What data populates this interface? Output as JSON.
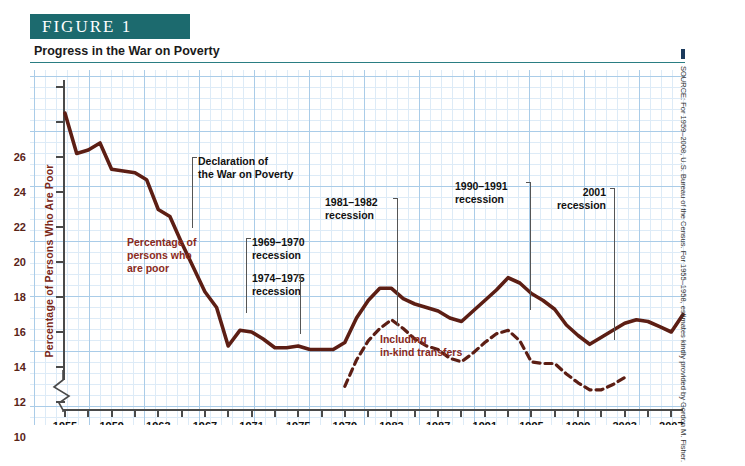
{
  "figure": {
    "banner_label": "FIGURE  1",
    "subtitle": "Progress in the War on Poverty",
    "banner_color": "#1c6a6e",
    "accent_color": "#7a2718"
  },
  "source_note": "SOURCE: For 1959–2008, U.S. Bureau of the Census. For 1955–1958, estimates kindly provided by Gordon M. Fisher.",
  "annotations": {
    "series_label": "Percentage of\npersons who\nare poor",
    "series_label_l1": "Percentage of",
    "series_label_l2": "persons who",
    "series_label_l3": "are poor",
    "declaration_l1": "Declaration of",
    "declaration_l2": "the War on Poverty",
    "rec1_l1": "1969–1970",
    "rec1_l2": "recession",
    "rec2_l1": "1974–1975",
    "rec2_l2": "recession",
    "rec3_l1": "1981–1982",
    "rec3_l2": "recession",
    "rec4_l1": "1990–1991",
    "rec4_l2": "recession",
    "rec5_l1": "2001",
    "rec5_l2": "recession",
    "inkind_l1": "Including",
    "inkind_l2": "in-kind transfers"
  },
  "chart_data": {
    "type": "line",
    "title": "Progress in the War on Poverty",
    "xlabel": "",
    "ylabel": "Percentage of Persons Who Are Poor",
    "xlim": [
      1955,
      2008
    ],
    "ylim": [
      7.6,
      26.4
    ],
    "yticks": [
      8,
      10,
      12,
      14,
      16,
      18,
      20,
      22,
      24,
      26
    ],
    "xticks": [
      1955,
      1957,
      1959,
      1961,
      1963,
      1965,
      1967,
      1969,
      1971,
      1973,
      1975,
      1977,
      1979,
      1981,
      1983,
      1985,
      1987,
      1989,
      1991,
      1993,
      1995,
      1997,
      1999,
      2001,
      2003,
      2005,
      2007
    ],
    "xtick_labels": [
      1955,
      1959,
      1963,
      1967,
      1971,
      1975,
      1979,
      1983,
      1987,
      1991,
      1995,
      1999,
      2003,
      2007
    ],
    "grid": true,
    "y_axis_break": true,
    "legend_position": "inline-annotation",
    "line_color": "#5c1e14",
    "series": [
      {
        "name": "Percentage of persons who are poor",
        "style": "solid",
        "x": [
          1955,
          1956,
          1957,
          1958,
          1959,
          1960,
          1961,
          1962,
          1963,
          1964,
          1965,
          1966,
          1967,
          1968,
          1969,
          1970,
          1971,
          1972,
          1973,
          1974,
          1975,
          1976,
          1977,
          1978,
          1979,
          1980,
          1981,
          1982,
          1983,
          1984,
          1985,
          1986,
          1987,
          1988,
          1989,
          1990,
          1991,
          1992,
          1993,
          1994,
          1995,
          1996,
          1997,
          1998,
          1999,
          2000,
          2001,
          2002,
          2003,
          2004,
          2005,
          2006,
          2007,
          2008
        ],
        "values": [
          24.5,
          22.2,
          22.4,
          22.8,
          21.3,
          21.2,
          21.1,
          20.7,
          19.0,
          18.6,
          17.1,
          15.7,
          14.3,
          13.4,
          11.2,
          12.1,
          12.0,
          11.6,
          11.1,
          11.1,
          11.2,
          11.0,
          11.0,
          11.0,
          11.4,
          12.8,
          13.8,
          14.5,
          14.5,
          13.9,
          13.6,
          13.4,
          13.2,
          12.8,
          12.6,
          13.2,
          13.8,
          14.4,
          15.1,
          14.8,
          14.2,
          13.8,
          13.3,
          12.4,
          11.8,
          11.3,
          11.7,
          12.1,
          12.5,
          12.7,
          12.6,
          12.3,
          12.0,
          13.0
        ]
      },
      {
        "name": "Including in-kind transfers",
        "style": "dashed",
        "x": [
          1979,
          1980,
          1981,
          1982,
          1983,
          1984,
          1985,
          1986,
          1987,
          1988,
          1989,
          1990,
          1991,
          1992,
          1993,
          1994,
          1995,
          1996,
          1997,
          1998,
          1999,
          2000,
          2001,
          2002,
          2003
        ],
        "values": [
          8.9,
          10.4,
          11.5,
          12.2,
          12.7,
          12.2,
          11.6,
          11.2,
          11.0,
          10.5,
          10.3,
          10.8,
          11.4,
          11.9,
          12.1,
          11.5,
          10.3,
          10.2,
          10.2,
          9.6,
          9.1,
          8.7,
          8.7,
          9.0,
          9.4
        ]
      }
    ],
    "event_markers": [
      {
        "label": "Declaration of the War on Poverty",
        "year": 1964
      },
      {
        "label": "1969–1970 recession",
        "years": [
          1969,
          1970
        ]
      },
      {
        "label": "1974–1975 recession",
        "years": [
          1974,
          1975
        ]
      },
      {
        "label": "1981–1982 recession",
        "years": [
          1981,
          1982
        ]
      },
      {
        "label": "1990–1991 recession",
        "years": [
          1990,
          1991
        ]
      },
      {
        "label": "2001 recession",
        "years": [
          2001
        ]
      }
    ]
  }
}
